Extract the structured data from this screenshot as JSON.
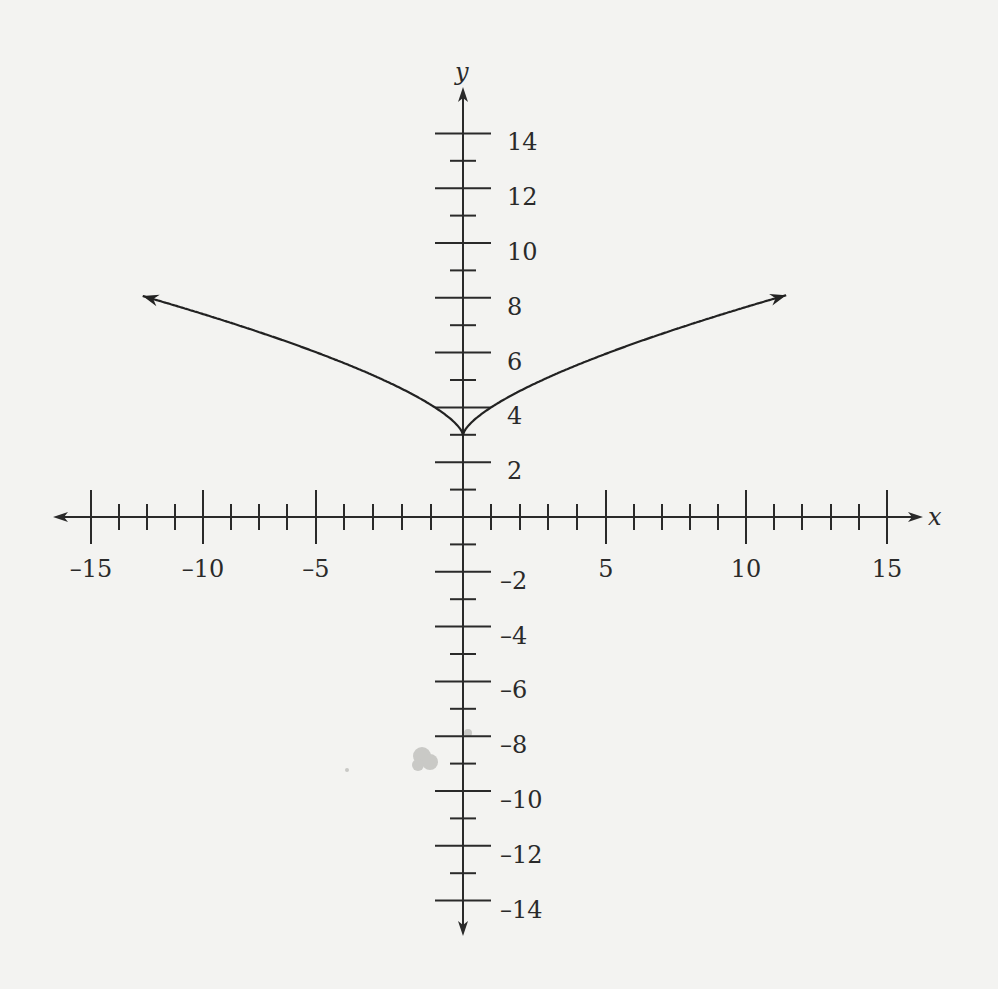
{
  "chart_data": {
    "type": "line",
    "title": "",
    "xlabel": "x",
    "ylabel": "y",
    "xlim": [
      -15,
      15
    ],
    "ylim": [
      -14,
      14
    ],
    "grid": false,
    "legend": null,
    "function": "y = x^(2/3) + 3",
    "vertex": [
      0,
      3
    ],
    "x_tick_labels": [
      "–15",
      "–10",
      "–5",
      "5",
      "10",
      "15"
    ],
    "x_tick_values": [
      -15,
      -10,
      -5,
      5,
      10,
      15
    ],
    "y_tick_labels": [
      "14",
      "12",
      "10",
      "8",
      "6",
      "4",
      "2",
      "–2",
      "–4",
      "–6",
      "–8",
      "–10",
      "–12",
      "–14"
    ],
    "y_tick_values": [
      14,
      12,
      10,
      8,
      6,
      4,
      2,
      -2,
      -4,
      -6,
      -8,
      -10,
      -12,
      -14
    ],
    "series": [
      {
        "name": "curve",
        "x": [
          -11.4,
          -10,
          -8,
          -6,
          -4,
          -2,
          -1,
          0,
          1,
          2,
          4,
          6,
          8,
          10,
          11.5
        ],
        "y": [
          8.07,
          7.64,
          7.0,
          6.3,
          5.52,
          4.59,
          4.0,
          3.0,
          4.0,
          4.59,
          5.52,
          6.3,
          7.0,
          7.64,
          8.1
        ],
        "arrows_at_ends": true
      }
    ]
  },
  "axes": {
    "x_label": "x",
    "y_label": "y"
  },
  "layout": {
    "origin_px": [
      463,
      517
    ],
    "x_px_per_unit": 28.1,
    "y_px_per_unit": 27.4,
    "x_major_px": {
      "-15": 91,
      "-10": 203,
      "-5": 316,
      "5": 606,
      "10": 746,
      "15": 887
    },
    "x_minor_px": [
      119,
      147,
      175,
      231,
      259,
      287,
      344,
      373,
      402,
      431,
      491,
      520,
      548,
      577,
      634,
      662,
      690,
      718,
      774,
      802,
      831,
      859
    ],
    "curve_color": "#222222",
    "axis_color": "#2a2a2a",
    "background": "#f3f3f1"
  }
}
